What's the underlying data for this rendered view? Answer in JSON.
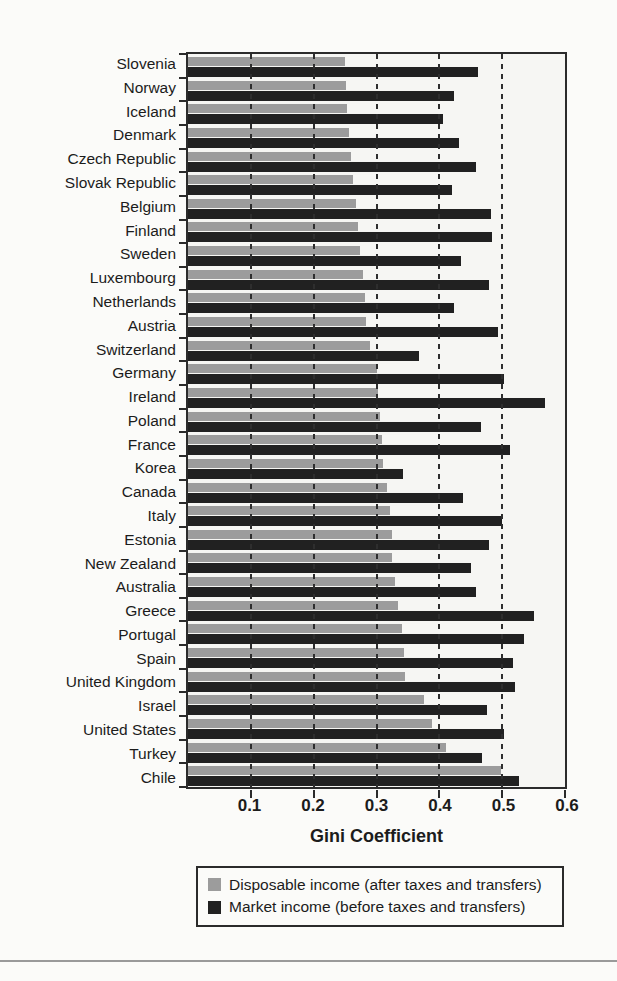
{
  "page": {
    "background": "#fbfbf9"
  },
  "chart_data": {
    "type": "bar",
    "orientation": "horizontal",
    "title": "",
    "xlabel": "Gini Coefficient",
    "ylabel": "",
    "xlim": [
      0,
      0.6
    ],
    "xticks": [
      0.1,
      0.2,
      0.3,
      0.4,
      0.5,
      0.6
    ],
    "xtick_labels": [
      "0.1",
      "0.2",
      "0.3",
      "0.4",
      "0.5",
      "0.6"
    ],
    "gridlines": {
      "style": "dashed",
      "positions": [
        0.1,
        0.2,
        0.3,
        0.4,
        0.5
      ]
    },
    "legend_position": "bottom",
    "categories": [
      "Slovenia",
      "Norway",
      "Iceland",
      "Denmark",
      "Czech Republic",
      "Slovak Republic",
      "Belgium",
      "Finland",
      "Sweden",
      "Luxembourg",
      "Netherlands",
      "Austria",
      "Switzerland",
      "Germany",
      "Ireland",
      "Poland",
      "France",
      "Korea",
      "Canada",
      "Italy",
      "Estonia",
      "New Zealand",
      "Australia",
      "Greece",
      "Portugal",
      "Spain",
      "United Kingdom",
      "Israel",
      "United States",
      "Turkey",
      "Chile"
    ],
    "series": [
      {
        "name": "Disposable income (after taxes and transfers)",
        "color": "#9c9c9c",
        "values": [
          0.25,
          0.251,
          0.253,
          0.256,
          0.259,
          0.263,
          0.268,
          0.27,
          0.274,
          0.278,
          0.281,
          0.284,
          0.29,
          0.3,
          0.302,
          0.305,
          0.309,
          0.311,
          0.317,
          0.321,
          0.324,
          0.325,
          0.329,
          0.335,
          0.341,
          0.344,
          0.346,
          0.376,
          0.389,
          0.41,
          0.498
        ]
      },
      {
        "name": "Market income (before taxes and transfers)",
        "color": "#212121",
        "values": [
          0.462,
          0.424,
          0.406,
          0.431,
          0.458,
          0.42,
          0.483,
          0.484,
          0.434,
          0.479,
          0.424,
          0.494,
          0.368,
          0.503,
          0.568,
          0.466,
          0.513,
          0.342,
          0.437,
          0.5,
          0.479,
          0.45,
          0.458,
          0.55,
          0.534,
          0.517,
          0.521,
          0.476,
          0.503,
          0.468,
          0.526
        ]
      }
    ]
  }
}
